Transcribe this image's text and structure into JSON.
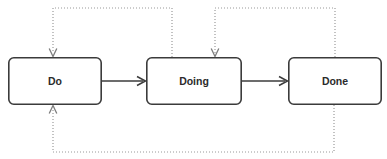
{
  "diagram": {
    "canvas": {
      "width": 387,
      "height": 159,
      "background": "#ffffff"
    },
    "style": {
      "node_fill": "#ffffff",
      "node_stroke": "#3b3b3b",
      "node_stroke_width": 1.6,
      "node_corner_radius": 5,
      "label_color": "#2b2b2b",
      "solid_edge_color": "#3b3b3b",
      "dotted_edge_color": "#9a9a9a",
      "dotted_pattern": "1 2"
    },
    "nodes": [
      {
        "id": "do",
        "label": "Do",
        "x": 8,
        "y": 57,
        "width": 94,
        "height": 48,
        "cx": 55,
        "cy": 81
      },
      {
        "id": "doing",
        "label": "Doing",
        "x": 146,
        "y": 57,
        "width": 96,
        "height": 48,
        "cx": 194,
        "cy": 81
      },
      {
        "id": "done",
        "label": "Done",
        "x": 288,
        "y": 57,
        "width": 94,
        "height": 48,
        "cx": 335,
        "cy": 81
      }
    ],
    "edges": [
      {
        "id": "do-to-doing",
        "from": "do",
        "to": "doing",
        "style": "solid",
        "label": "",
        "path": "M 102 81 L 143 81"
      },
      {
        "id": "doing-to-done",
        "from": "doing",
        "to": "done",
        "style": "solid",
        "label": "",
        "path": "M 242 81 L 285 81"
      },
      {
        "id": "doing-back-to-do",
        "from": "doing",
        "to": "do",
        "style": "dotted",
        "label": "",
        "path": "M 172 57 L 172 8 L 53 8 L 53 54"
      },
      {
        "id": "done-back-to-doing",
        "from": "done",
        "to": "doing",
        "style": "dotted",
        "label": "",
        "path": "M 335 57 L 335 8 L 215 8 L 215 54"
      },
      {
        "id": "done-back-to-do",
        "from": "done",
        "to": "do",
        "style": "dotted",
        "label": "",
        "path": "M 334 105 L 334 152 L 53 152 L 53 109"
      }
    ]
  }
}
